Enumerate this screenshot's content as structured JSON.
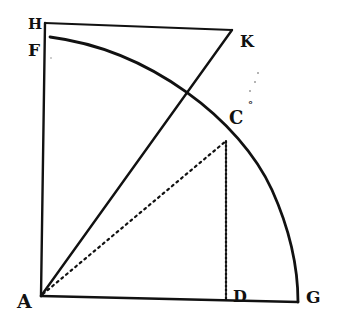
{
  "diagram": {
    "type": "geometric-figure",
    "style": {
      "ink": "#111111",
      "background": "#ffffff"
    },
    "points": {
      "H": {
        "label": "H",
        "x": 45,
        "y": 23
      },
      "K": {
        "label": "K",
        "x": 232,
        "y": 30
      },
      "F": {
        "label": "F",
        "x": 50,
        "y": 37
      },
      "C": {
        "label": "C",
        "x": 226,
        "y": 141
      },
      "A": {
        "label": "A",
        "x": 41,
        "y": 296
      },
      "D": {
        "label": "D",
        "x": 226,
        "y": 299
      },
      "G": {
        "label": "G",
        "x": 298,
        "y": 302
      }
    },
    "labels": {
      "H": "H",
      "F": "F",
      "K": "K",
      "C": "C",
      "small_mark": "°",
      "A": "A",
      "D": "D",
      "G": "G"
    },
    "segments": [
      {
        "from": "H",
        "to": "K",
        "style": "solid"
      },
      {
        "from": "H",
        "to": "A",
        "style": "solid"
      },
      {
        "from": "A",
        "to": "G",
        "style": "solid"
      },
      {
        "from": "A",
        "to": "K",
        "style": "solid"
      },
      {
        "from": "A",
        "to": "C",
        "style": "dotted"
      },
      {
        "from": "C",
        "to": "D",
        "style": "dotted"
      }
    ],
    "arcs": [
      {
        "from": "F",
        "to": "G",
        "center": "A",
        "style": "solid"
      }
    ]
  }
}
